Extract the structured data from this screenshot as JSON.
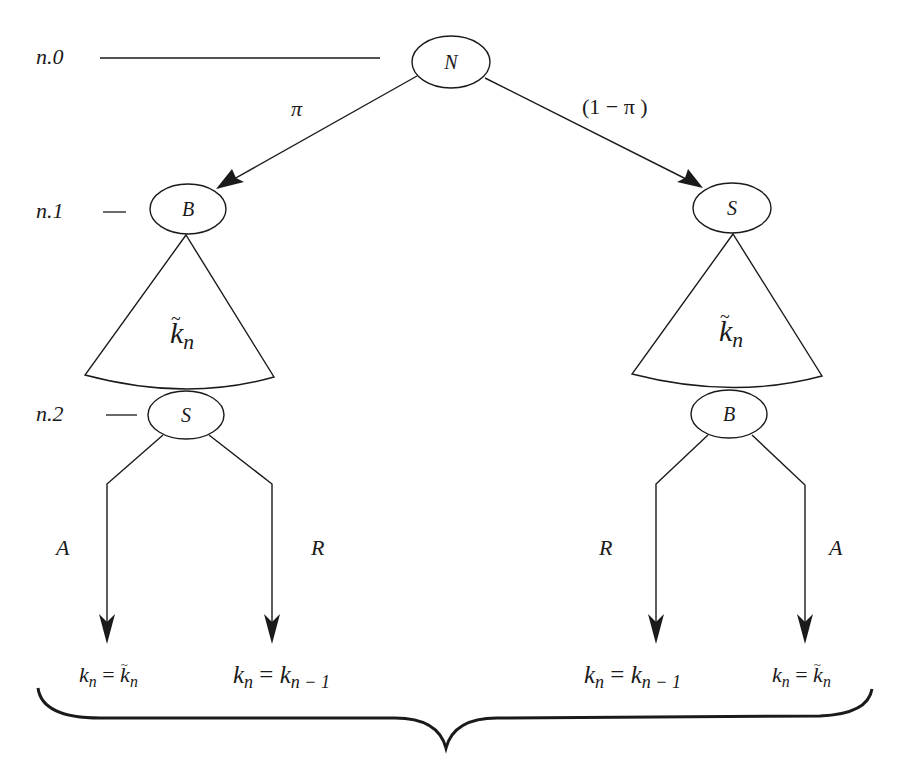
{
  "diagram": {
    "type": "game-tree",
    "levels": [
      {
        "id": "n0",
        "label": "n.0"
      },
      {
        "id": "n1",
        "label": "n.1"
      },
      {
        "id": "n2",
        "label": "n.2"
      }
    ],
    "nodes": {
      "root": {
        "label": "N"
      },
      "left_n1": {
        "label": "B"
      },
      "right_n1": {
        "label": "S"
      },
      "left_n2": {
        "label": "S"
      },
      "right_n2": {
        "label": "B"
      }
    },
    "edges": {
      "root_left": {
        "label": "π"
      },
      "root_right": {
        "label": "(1 − π )"
      }
    },
    "info_sets": {
      "left": {
        "base": "k",
        "sub": "n",
        "tilde": true
      },
      "right": {
        "base": "k",
        "sub": "n",
        "tilde": true
      }
    },
    "actions": {
      "left_A": "A",
      "left_R": "R",
      "right_R": "R",
      "right_A": "A"
    },
    "outcomes": [
      {
        "id": "left_accept",
        "lhs": "k",
        "lhs_sub": "n",
        "eq": "=",
        "rhs": "k",
        "rhs_sub": "n",
        "rhs_tilde": true
      },
      {
        "id": "left_reject",
        "lhs": "k",
        "lhs_sub": "n",
        "eq": "=",
        "rhs": "k",
        "rhs_sub": "n − 1",
        "rhs_tilde": false
      },
      {
        "id": "right_reject",
        "lhs": "k",
        "lhs_sub": "n",
        "eq": "=",
        "rhs": "k",
        "rhs_sub": "n − 1",
        "rhs_tilde": false
      },
      {
        "id": "right_accept",
        "lhs": "k",
        "lhs_sub": "n",
        "eq": "=",
        "rhs": "k",
        "rhs_sub": "n",
        "rhs_tilde": true
      }
    ],
    "colors": {
      "stroke": "#1a1a1a",
      "background": "#ffffff"
    }
  }
}
